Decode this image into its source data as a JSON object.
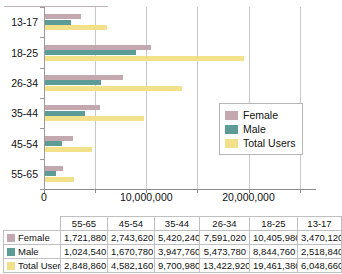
{
  "chart_data": {
    "type": "bar",
    "orientation": "horizontal",
    "title": "",
    "xlabel": "",
    "ylabel": "",
    "categories": [
      "13-17",
      "18-25",
      "26-34",
      "35-44",
      "45-54",
      "55-65"
    ],
    "series": [
      {
        "name": "Female",
        "color": "#c4a8b0",
        "values": [
          3470120,
          10405980,
          7591020,
          5420240,
          2743620,
          1721880
        ]
      },
      {
        "name": "Male",
        "color": "#5d9b96",
        "values": [
          2518840,
          8844760,
          5473780,
          3947760,
          1670780,
          1024540
        ]
      },
      {
        "name": "Total Users",
        "color": "#f2e08a",
        "values": [
          6048660,
          19461380,
          13422920,
          9700980,
          4582160,
          2848860
        ]
      }
    ],
    "xlim": [
      0,
      26500000
    ],
    "xticks": [
      0,
      10000000,
      20000000
    ],
    "xtick_labels": [
      "0",
      "10,000,000",
      "20,000,000"
    ],
    "minor_gridlines": [
      5000000,
      15000000,
      25000000
    ],
    "grid": true,
    "legend_position": "inside-right"
  },
  "legend": {
    "items": [
      {
        "label": "Female",
        "swatch": "female-swatch"
      },
      {
        "label": "Male",
        "swatch": "male-swatch"
      },
      {
        "label": "Total Users",
        "swatch": "total-users-swatch"
      }
    ]
  },
  "table": {
    "corner": "",
    "columns": [
      "55-65",
      "45-54",
      "35-44",
      "26-34",
      "18-25",
      "13-17"
    ],
    "rows": [
      {
        "label": "Female",
        "swatch": "female-swatch",
        "values": [
          "1,721,880",
          "2,743,620",
          "5,420,240",
          "7,591,020",
          "10,405,980",
          "3,470,120"
        ]
      },
      {
        "label": "Male",
        "swatch": "male-swatch",
        "values": [
          "1,024,540",
          "1,670,780",
          "3,947,760",
          "5,473,780",
          "8,844,760",
          "2,518,840"
        ]
      },
      {
        "label": "Total Users",
        "swatch": "total-users-swatch",
        "values": [
          "2,848,860",
          "4,582,160",
          "9,700,980",
          "13,422,920",
          "19,461,380",
          "6,048,660"
        ]
      }
    ]
  }
}
